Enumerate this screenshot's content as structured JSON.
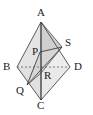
{
  "figure": {
    "type": "geometry-diagram",
    "shape": "rhombus-with-inscribed-triangle",
    "width": 93,
    "height": 115,
    "background_color": "#ffffff",
    "stroke_color": "#4d4d4d",
    "dark_stroke_color": "#2b2b2b",
    "fill_light": "#e8e8e8",
    "fill_mid": "#dedede",
    "fill_dark": "#d2d2d2",
    "label_color": "#1a1a1a"
  },
  "points": {
    "A": {
      "label": "A",
      "x": 41,
      "y": 22,
      "label_x": 37,
      "label_y": 7
    },
    "B": {
      "label": "B",
      "x": 17,
      "y": 67,
      "label_x": 3,
      "label_y": 61
    },
    "C": {
      "label": "C",
      "x": 41,
      "y": 100,
      "label_x": 37,
      "label_y": 100
    },
    "D": {
      "label": "D",
      "x": 70,
      "y": 67,
      "label_x": 74,
      "label_y": 61
    },
    "P": {
      "label": "P",
      "x": 40,
      "y": 52,
      "label_x": 32,
      "label_y": 47
    },
    "Q": {
      "label": "Q",
      "x": 27,
      "y": 85,
      "label_x": 16,
      "label_y": 85
    },
    "R": {
      "label": "R",
      "x": 41,
      "y": 73,
      "label_x": 44,
      "label_y": 71
    },
    "S": {
      "label": "S",
      "x": 62,
      "y": 47,
      "label_x": 65,
      "label_y": 38
    }
  },
  "segments": {
    "rhombus_edges": [
      "A-B",
      "B-C",
      "C-D",
      "D-A"
    ],
    "diagonal_vertical": "A-C",
    "diagonal_horizontal_dashed": "B-D",
    "inner_triangle": [
      "P-Q",
      "Q-S",
      "S-P"
    ],
    "extra": [
      "A-S",
      "Q-R",
      "R-S"
    ]
  },
  "styles": {
    "dashed_pattern": "2 2",
    "edge_width": 0.9,
    "diagonal_width": 1.2
  }
}
